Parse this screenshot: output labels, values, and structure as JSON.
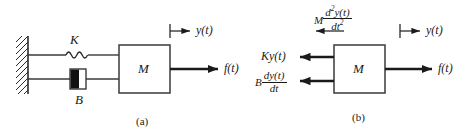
{
  "figure": {
    "width": 472,
    "height": 136,
    "background": "#ffffff",
    "ink_color": "#1a1a1a"
  },
  "panel_a": {
    "caption": "(a)",
    "wall": {
      "name": "fixed-wall",
      "hatched": true
    },
    "spring": {
      "label": "K",
      "coils": 4
    },
    "damper": {
      "label": "B"
    },
    "mass": {
      "label": "M"
    },
    "displacement": {
      "label": "y(t)",
      "direction": "right"
    },
    "force": {
      "label": "f(t)",
      "direction": "right"
    }
  },
  "panel_b": {
    "caption": "(b)",
    "mass": {
      "label": "M"
    },
    "displacement": {
      "label": "y(t)",
      "direction": "right"
    },
    "force": {
      "label": "f(t)",
      "direction": "right"
    },
    "inertia_force": {
      "coefficient": "M",
      "numerator": "d",
      "numerator_exp": "2",
      "numerator_rest": "y(t)",
      "denominator": "dt",
      "denominator_exp": "2",
      "direction": "left"
    },
    "spring_force": {
      "label": "Ky(t)",
      "direction": "left"
    },
    "damper_force": {
      "coefficient": "B",
      "numerator": "dy(t)",
      "denominator": "dt",
      "direction": "left"
    }
  }
}
